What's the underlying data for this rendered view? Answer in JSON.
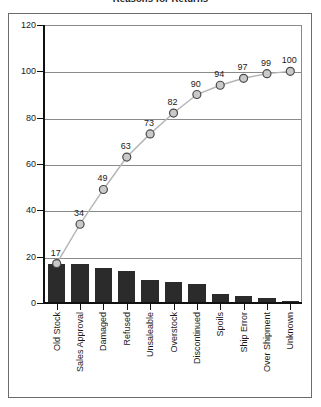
{
  "chart_data": {
    "type": "bar",
    "title": "Reasons for Returns",
    "xlabel": "",
    "ylabel": "",
    "ylim": [
      0,
      120
    ],
    "yticks": [
      0,
      20,
      40,
      60,
      80,
      100,
      120
    ],
    "grid": true,
    "legend": "none",
    "categories": [
      "Old Stock",
      "Sales Approval",
      "Damaged",
      "Refused",
      "Unsaleable",
      "Overstock",
      "Discontinued",
      "Spoils",
      "Ship Error",
      "Over Shipment",
      "Unknown"
    ],
    "series": [
      {
        "name": "Count",
        "type": "bar",
        "values": [
          17,
          17,
          15,
          14,
          10,
          9,
          8,
          4,
          3,
          2,
          1
        ]
      },
      {
        "name": "Cumulative %",
        "type": "line",
        "values": [
          17,
          34,
          49,
          63,
          73,
          82,
          90,
          94,
          97,
          99,
          100
        ],
        "labels": [
          "17",
          "34",
          "49",
          "63",
          "73",
          "82",
          "90",
          "94",
          "97",
          "99",
          "100"
        ]
      }
    ]
  },
  "style": {
    "bar_color": "#2b2b2b",
    "line_color": "#b4b4b4",
    "marker_fill": "#c9c9c9",
    "marker_stroke": "#4a4a4a",
    "grid_color": "#8a8a8a",
    "axis_color": "#111111",
    "frame_color": "#6b6b6b",
    "text_color": "#1a1a1a",
    "background": "#ffffff"
  }
}
